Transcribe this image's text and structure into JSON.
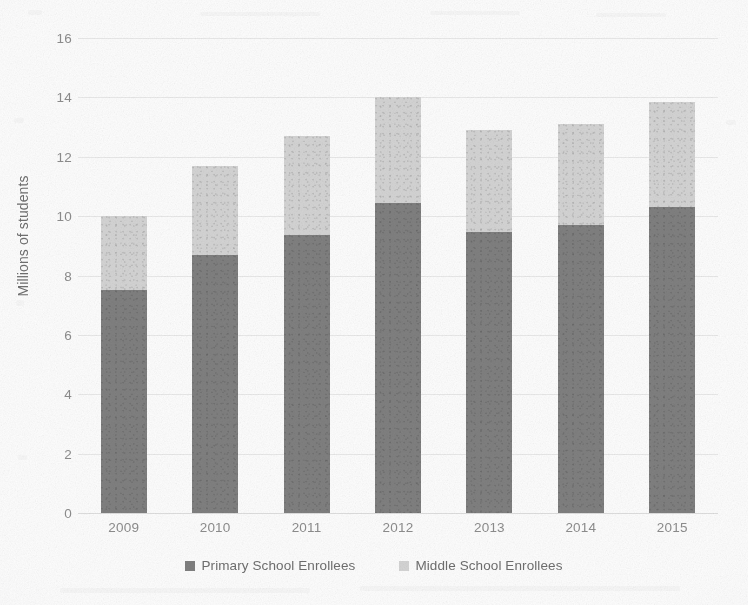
{
  "chart_data": {
    "type": "bar",
    "subtype": "stacked-bar",
    "title": "",
    "subtitle": "",
    "xlabel": "",
    "ylabel": "Millions of students",
    "categories": [
      "2009",
      "2010",
      "2011",
      "2012",
      "2013",
      "2014",
      "2015"
    ],
    "series": [
      {
        "name": "Primary School Enrollees",
        "color": "#808080",
        "values": [
          7.5,
          8.7,
          9.35,
          10.45,
          9.45,
          9.7,
          10.3
        ]
      },
      {
        "name": "Middle School Enrollees",
        "color": "#d4d4d4",
        "values": [
          2.5,
          3.0,
          3.35,
          3.55,
          3.45,
          3.4,
          3.55
        ]
      }
    ],
    "totals": [
      10.0,
      11.7,
      12.7,
      14.0,
      12.9,
      13.1,
      13.85
    ],
    "ylim": [
      0,
      16
    ],
    "ytick_step": 2,
    "yticks": [
      16,
      14,
      12,
      10,
      8,
      6,
      4,
      2,
      0
    ],
    "ytick_labels": [
      "16",
      "14",
      "12",
      "10",
      "8",
      "6",
      "4",
      "2",
      "0"
    ],
    "grid": true,
    "grid_axis": "y",
    "legend_position": "bottom",
    "legend": [
      "Primary School Enrollees",
      "Middle School Enrollees"
    ]
  },
  "axis": {
    "y_title": "Millions of students"
  },
  "legend": {
    "items": [
      {
        "label": "Primary School Enrollees",
        "marker": "square-marker"
      },
      {
        "label": "Middle School Enrollees",
        "marker": "square-marker"
      }
    ]
  },
  "colors": {
    "primary_series": "#808080",
    "middle_series": "#d4d4d4",
    "gridline": "#e9e9e9",
    "tick_text": "#8d8d8d",
    "axis_title_text": "#6f6f6f",
    "background": "#fdfdfd"
  }
}
